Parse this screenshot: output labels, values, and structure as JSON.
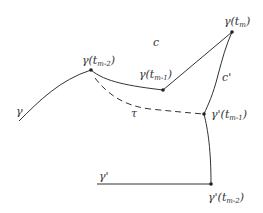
{
  "diagram": {
    "colors": {
      "stroke": "#333333",
      "background": "#ffffff"
    },
    "curves": [
      {
        "id": "gamma",
        "style": "solid",
        "label": "γ"
      },
      {
        "id": "gamma-prime",
        "style": "solid",
        "label": "γ'"
      },
      {
        "id": "c",
        "style": "solid",
        "label": "c"
      },
      {
        "id": "c-prime",
        "style": "solid",
        "label": "c'"
      },
      {
        "id": "tau",
        "style": "dashed",
        "label": "τ"
      }
    ],
    "points": [
      {
        "id": "gamma-t-m-2",
        "base": "γ(t",
        "sub": "m-2",
        "close": ")"
      },
      {
        "id": "gamma-t-m-1",
        "base": "γ(t",
        "sub": "m-1",
        "close": ")"
      },
      {
        "id": "gamma-t-m",
        "base": "γ(t",
        "sub": "m",
        "close": ")"
      },
      {
        "id": "gamma-prime-t-m-1",
        "base": "γ'(t",
        "sub": "m-1",
        "close": ")"
      },
      {
        "id": "gamma-prime-t-m-2",
        "base": "γ'(t",
        "sub": "m-2",
        "close": ")"
      }
    ]
  }
}
